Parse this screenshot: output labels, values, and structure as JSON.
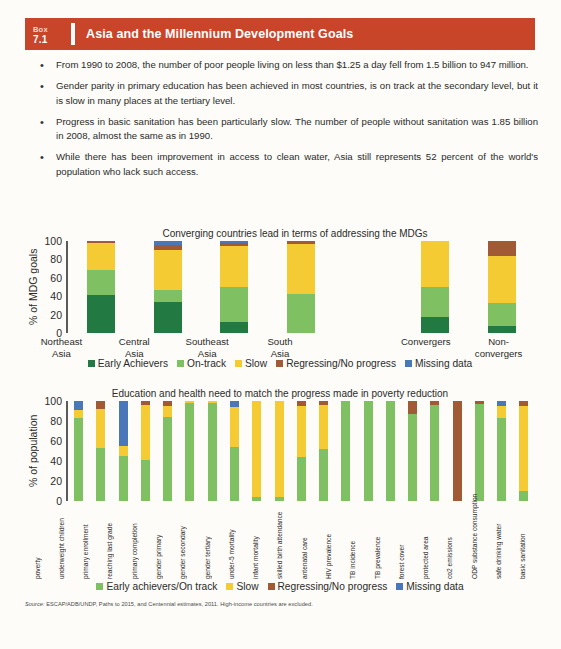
{
  "banner": {
    "box_word": "Box",
    "box_number": "7.1",
    "title": "Asia and the Millennium Development Goals"
  },
  "bullets": [
    "From 1990 to 2008, the number of poor people living on less than $1.25 a day fell from 1.5 billion to 947 million.",
    "Gender parity in primary education has been achieved in most countries, is on track at the secondary level, but it is slow in many places at the tertiary level.",
    "Progress in basic sanitation has been particularly slow. The number of people without sanitation was 1.85 billion in 2008, almost the same as in 1990.",
    "While there has been improvement in access to clean water, Asia still represents 52 percent of the world's population who lack such access."
  ],
  "bullet_marker": "•",
  "colors": {
    "early_achievers": "#227942",
    "on_track": "#7fc063",
    "slow": "#f5cb34",
    "regressing": "#a05a35",
    "missing": "#4a77b8",
    "banner": "#c9452a",
    "page_bg": "#fdfcf8",
    "axis": "#5a5a5a"
  },
  "source": {
    "label": "Source:",
    "text": " ESCAP/ADB/UNDP, Paths to 2015, and Centennial estimates, 2011. High-income countries are excluded."
  },
  "chart_data": [
    {
      "id": "chart1",
      "type": "bar",
      "stacked": true,
      "title": "Converging countries lead in terms of addressing the MDGs",
      "xlabel": "",
      "ylabel": "% of MDG goals",
      "ylim": [
        0,
        100
      ],
      "yticks": [
        0,
        20,
        40,
        60,
        80,
        100
      ],
      "grid": false,
      "legend_position": "bottom",
      "categories": [
        "Northeast Asia",
        "Central Asia",
        "Southeast Asia",
        "South Asia",
        "",
        "Convergers",
        "Non-convergers"
      ],
      "category_lines": [
        [
          "Northeast",
          "Asia"
        ],
        [
          "Central",
          "Asia"
        ],
        [
          "Southeast",
          "Asia"
        ],
        [
          "South",
          "Asia"
        ],
        [
          "",
          ""
        ],
        [
          "Convergers",
          ""
        ],
        [
          "Non-",
          "convergers"
        ]
      ],
      "series": [
        {
          "name": "Early Achievers",
          "color": "#227942",
          "values": [
            41,
            34,
            12,
            0,
            null,
            17,
            8
          ]
        },
        {
          "name": "On-track",
          "color": "#7fc063",
          "values": [
            28,
            13,
            38,
            42,
            null,
            33,
            25
          ]
        },
        {
          "name": "Slow",
          "color": "#f5cb34",
          "values": [
            29,
            43,
            45,
            55,
            null,
            50,
            51
          ]
        },
        {
          "name": "Regressing/No progress",
          "color": "#a05a35",
          "values": [
            2,
            6,
            3,
            3,
            null,
            0,
            16
          ]
        },
        {
          "name": "Missing data",
          "color": "#4a77b8",
          "values": [
            0,
            4,
            2,
            0,
            null,
            0,
            0
          ]
        }
      ]
    },
    {
      "id": "chart2",
      "type": "bar",
      "stacked": true,
      "title": "Education and health need to match the progress made in poverty reduction",
      "xlabel": "",
      "ylabel": "% of population",
      "ylim": [
        0,
        100
      ],
      "yticks": [
        0,
        20,
        40,
        60,
        80,
        100
      ],
      "grid": false,
      "legend_position": "bottom",
      "categories": [
        "poverty",
        "underweight children",
        "primary enrollment",
        "reaching last grade",
        "primary completion",
        "gender primary",
        "gender secondary",
        "gender tertiary",
        "under-5 mortality",
        "infant mortality",
        "skilled birth attendance",
        "antenatal care",
        "HIV prevalence",
        "TB incidence",
        "TB prevalence",
        "forest cover",
        "protected area",
        "co2 emissions",
        "ODP substance consumption",
        "safe drinking water",
        "basic sanitation"
      ],
      "series": [
        {
          "name": "Early achievers/On track",
          "color": "#7fc063",
          "values": [
            83,
            53,
            45,
            41,
            84,
            98,
            98,
            54,
            4,
            4,
            44,
            52,
            100,
            100,
            100,
            87,
            96,
            0,
            97,
            83,
            10
          ]
        },
        {
          "name": "Slow",
          "color": "#f5cb34",
          "values": [
            8,
            39,
            10,
            55,
            11,
            2,
            2,
            40,
            96,
            96,
            51,
            44,
            0,
            0,
            0,
            0,
            0,
            0,
            0,
            12,
            85
          ]
        },
        {
          "name": "Regressing/No progress",
          "color": "#a05a35",
          "values": [
            0,
            8,
            0,
            4,
            5,
            0,
            0,
            0,
            0,
            0,
            5,
            4,
            0,
            0,
            0,
            13,
            4,
            100,
            3,
            0,
            5
          ]
        },
        {
          "name": "Missing data",
          "color": "#4a77b8",
          "values": [
            9,
            0,
            45,
            0,
            0,
            0,
            0,
            6,
            0,
            0,
            0,
            0,
            0,
            0,
            0,
            0,
            0,
            0,
            0,
            5,
            0
          ]
        }
      ]
    }
  ],
  "legend1": [
    {
      "label": "Early Achievers",
      "color": "#227942"
    },
    {
      "label": "On-track",
      "color": "#7fc063"
    },
    {
      "label": "Slow",
      "color": "#f5cb34"
    },
    {
      "label": "Regressing/No progress",
      "color": "#a05a35"
    },
    {
      "label": "Missing data",
      "color": "#4a77b8"
    }
  ],
  "legend2": [
    {
      "label": "Early achievers/On track",
      "color": "#7fc063"
    },
    {
      "label": "Slow",
      "color": "#f5cb34"
    },
    {
      "label": "Regressing/No progress",
      "color": "#a05a35"
    },
    {
      "label": "Missing data",
      "color": "#4a77b8"
    }
  ]
}
